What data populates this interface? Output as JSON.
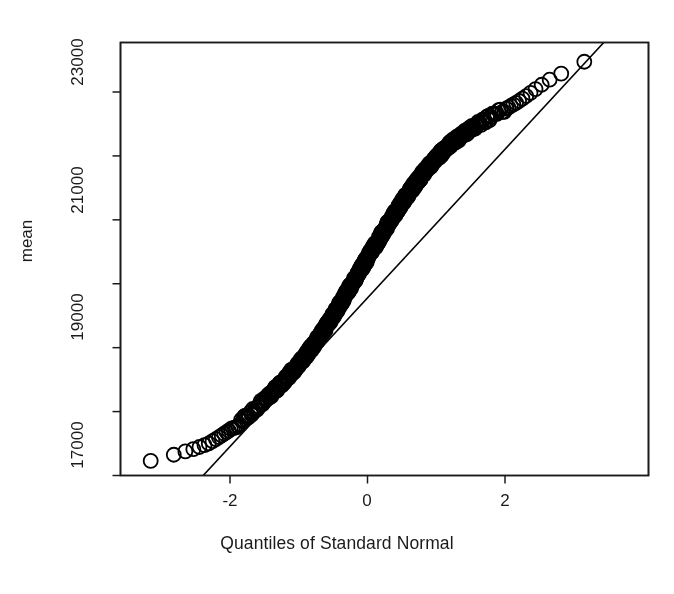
{
  "chart_data": {
    "type": "scatter",
    "title": "",
    "subtitle": "",
    "xlabel": "Quantiles of Standard Normal",
    "ylabel": "mean",
    "xlim": [
      -3.6,
      3.6
    ],
    "ylim": [
      16950,
      23800
    ],
    "grid": false,
    "legend": null,
    "x_ticks": [
      {
        "value": -2,
        "label": "-2"
      },
      {
        "value": 0,
        "label": "0"
      },
      {
        "value": 2,
        "label": "2"
      }
    ],
    "y_ticks": [
      {
        "value": 17000,
        "label": "17000"
      },
      {
        "value": 18000,
        "label": ""
      },
      {
        "value": 19000,
        "label": "19000"
      },
      {
        "value": 20000,
        "label": ""
      },
      {
        "value": 21000,
        "label": "21000"
      },
      {
        "value": 22000,
        "label": ""
      },
      {
        "value": 23000,
        "label": "23000"
      }
    ],
    "marker": {
      "shape": "open-circle",
      "radius_px": 7,
      "stroke": "#000000",
      "fill": "none",
      "stroke_width_px": 1.8
    },
    "reference_line": {
      "description": "robust qq line through first and third quartiles",
      "color": "#000000",
      "width_px": 1.6,
      "x_start": -2.39,
      "y_start": 17000,
      "x_end": 3.45,
      "y_end": 23790
    },
    "series": [
      {
        "name": "mean",
        "n_points": 620,
        "comment": "theoretical normal quantiles vs sample quantiles; S-shaped heavy-tailed deviation",
        "points": [
          [
            -3.35,
            17150
          ],
          [
            -3.05,
            17270
          ],
          [
            -2.92,
            17300
          ],
          [
            -2.83,
            17320
          ],
          [
            -2.76,
            17345
          ],
          [
            -2.7,
            17360
          ],
          [
            -2.64,
            17380
          ],
          [
            -2.59,
            17395
          ],
          [
            -2.54,
            17410
          ],
          [
            -2.5,
            17425
          ],
          [
            -2.46,
            17440
          ],
          [
            -2.42,
            17455
          ],
          [
            -2.38,
            17470
          ],
          [
            -2.35,
            17485
          ],
          [
            -2.31,
            17500
          ],
          [
            -2.28,
            17520
          ],
          [
            -2.25,
            17540
          ],
          [
            -2.22,
            17560
          ],
          [
            -2.19,
            17580
          ],
          [
            -2.16,
            17600
          ],
          [
            -2.13,
            17620
          ],
          [
            -2.1,
            17640
          ],
          [
            -2.08,
            17660
          ],
          [
            -2.05,
            17680
          ],
          [
            -2.02,
            17700
          ],
          [
            -2.0,
            17720
          ],
          [
            -1.97,
            17740
          ],
          [
            -1.95,
            17760
          ],
          [
            -1.92,
            17780
          ],
          [
            -1.9,
            17800
          ],
          [
            -1.88,
            17820
          ],
          [
            -1.85,
            17840
          ],
          [
            -1.83,
            17860
          ],
          [
            -1.81,
            17880
          ],
          [
            -1.79,
            17900
          ],
          [
            -1.76,
            17920
          ],
          [
            -1.74,
            17940
          ],
          [
            -1.72,
            17960
          ],
          [
            -1.7,
            17980
          ],
          [
            -1.68,
            18000
          ],
          [
            -1.6,
            18080
          ],
          [
            -1.5,
            18180
          ],
          [
            -1.4,
            18280
          ],
          [
            -1.3,
            18385
          ],
          [
            -1.2,
            18500
          ],
          [
            -1.1,
            18620
          ],
          [
            -1.0,
            18745
          ],
          [
            -0.9,
            18880
          ],
          [
            -0.8,
            19020
          ],
          [
            -0.7,
            19170
          ],
          [
            -0.6,
            19330
          ],
          [
            -0.5,
            19500
          ],
          [
            -0.4,
            19680
          ],
          [
            -0.3,
            19860
          ],
          [
            -0.2,
            20040
          ],
          [
            -0.1,
            20220
          ],
          [
            0.0,
            20400
          ],
          [
            0.1,
            20580
          ],
          [
            0.2,
            20760
          ],
          [
            0.3,
            20935
          ],
          [
            0.4,
            21105
          ],
          [
            0.5,
            21270
          ],
          [
            0.6,
            21425
          ],
          [
            0.7,
            21575
          ],
          [
            0.8,
            21715
          ],
          [
            0.9,
            21845
          ],
          [
            1.0,
            21965
          ],
          [
            1.1,
            22075
          ],
          [
            1.2,
            22175
          ],
          [
            1.3,
            22265
          ],
          [
            1.4,
            22345
          ],
          [
            1.5,
            22420
          ],
          [
            1.6,
            22490
          ],
          [
            1.7,
            22555
          ],
          [
            1.8,
            22615
          ],
          [
            1.9,
            22675
          ],
          [
            2.0,
            22730
          ],
          [
            2.1,
            22790
          ],
          [
            2.2,
            22855
          ],
          [
            2.3,
            22930
          ],
          [
            2.4,
            23010
          ],
          [
            2.5,
            23090
          ],
          [
            2.6,
            23160
          ],
          [
            2.7,
            23225
          ],
          [
            2.8,
            23280
          ],
          [
            2.9,
            23320
          ],
          [
            3.05,
            23380
          ],
          [
            3.35,
            23650
          ]
        ]
      }
    ]
  },
  "axes": {
    "y_tick_labels": [
      "17000",
      "19000",
      "21000",
      "23000"
    ],
    "x_tick_labels": [
      "-2",
      "0",
      "2"
    ],
    "x_axis_title": "Quantiles of Standard Normal",
    "y_axis_title": "mean"
  },
  "style": {
    "background": "#ffffff",
    "foreground": "#000000",
    "axis_color": "#1b1b1b"
  }
}
